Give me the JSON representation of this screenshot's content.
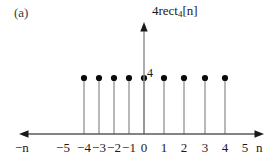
{
  "figure": {
    "panel_label": "(a)",
    "signal_label_main": "4rect",
    "signal_label_sub": "4",
    "signal_label_tail": "[n]",
    "amplitude_label": "4",
    "x_axis_left_name": "−n",
    "x_axis_right_name": "n",
    "colors": {
      "stem": "#9a9a9a",
      "dot": "#0a0a0a",
      "axis": "#5a5a5a",
      "text": "#1a1a1a"
    }
  },
  "chart_data": {
    "type": "scatter",
    "plot_style": "stem",
    "xlabel": "n",
    "ylabel": "4rect_4[n]",
    "x": [
      -4,
      -3,
      -2,
      -1,
      0,
      1,
      2,
      3,
      4
    ],
    "values": [
      4,
      4,
      4,
      4,
      4,
      4,
      4,
      4,
      4
    ],
    "xlim": [
      -6,
      6
    ],
    "ylim": [
      0,
      8
    ],
    "xticks": [
      -5,
      -4,
      -3,
      -2,
      -1,
      0,
      1,
      2,
      3,
      4,
      5
    ],
    "xtick_labels": [
      "−5",
      "−4",
      "−3",
      "−2",
      "−1",
      "0",
      "1",
      "2",
      "3",
      "4",
      "5"
    ],
    "yticks": [
      4
    ],
    "ytick_labels": [
      "4"
    ],
    "grid": false,
    "legend": null,
    "annotations": [
      {
        "text": "(a)",
        "position": "top-left"
      },
      {
        "text": "4",
        "position": "y-axis at amplitude 4"
      },
      {
        "text": "4rect_4[n]",
        "position": "above y-axis arrow"
      },
      {
        "text": "−n",
        "position": "left end of x-axis"
      },
      {
        "text": "n",
        "position": "right end of x-axis"
      }
    ]
  },
  "ticks": [
    {
      "label": "−5",
      "x": -5,
      "px": 63,
      "has_mark": false
    },
    {
      "label": "−4",
      "x": -4,
      "px": 84,
      "has_mark": true
    },
    {
      "label": "−3",
      "x": -3,
      "px": 99,
      "has_mark": true
    },
    {
      "label": "−2",
      "x": -2,
      "px": 114,
      "has_mark": true
    },
    {
      "label": "−1",
      "x": -1,
      "px": 129,
      "has_mark": true
    },
    {
      "label": "0",
      "x": 0,
      "px": 144,
      "has_mark": true
    },
    {
      "label": "1",
      "x": 1,
      "px": 164,
      "has_mark": true
    },
    {
      "label": "2",
      "x": 2,
      "px": 184,
      "has_mark": true
    },
    {
      "label": "3",
      "x": 3,
      "px": 205,
      "has_mark": true
    },
    {
      "label": "4",
      "x": 4,
      "px": 225,
      "has_mark": true
    },
    {
      "label": "5",
      "x": 5,
      "px": 245,
      "has_mark": false
    }
  ]
}
